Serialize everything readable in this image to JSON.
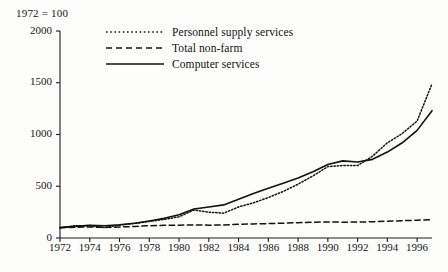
{
  "index_note": "1972 = 100",
  "legend": {
    "position": "top-center",
    "items": [
      {
        "label": "Personnel supply services",
        "style": "dotted",
        "icon": "dotted-line-icon"
      },
      {
        "label": "Total non-farm",
        "style": "dashed",
        "icon": "dashed-line-icon"
      },
      {
        "label": "Computer services",
        "style": "solid",
        "icon": "solid-line-icon"
      }
    ]
  },
  "chart_data": {
    "type": "line",
    "title": "",
    "subtitle": "",
    "xlabel": "",
    "ylabel": "1972 = 100",
    "xlim": [
      1972,
      1997
    ],
    "ylim": [
      0,
      2000
    ],
    "grid": false,
    "yticks": [
      0,
      500,
      1000,
      1500,
      2000
    ],
    "ytick_labels": [
      "0",
      "500",
      "1000",
      "1500",
      "2000"
    ],
    "xticks": [
      1972,
      1974,
      1976,
      1978,
      1980,
      1982,
      1984,
      1986,
      1988,
      1990,
      1992,
      1994,
      1996
    ],
    "xtick_labels": [
      "1972",
      "1974",
      "1976",
      "1978",
      "1980",
      "1982",
      "1984",
      "1986",
      "1988",
      "1990",
      "1992",
      "1994",
      "1996"
    ],
    "x": [
      1972,
      1973,
      1974,
      1975,
      1976,
      1977,
      1978,
      1979,
      1980,
      1981,
      1982,
      1983,
      1984,
      1985,
      1986,
      1987,
      1988,
      1989,
      1990,
      1991,
      1992,
      1993,
      1994,
      1995,
      1996,
      1997
    ],
    "series": [
      {
        "name": "Personnel supply services",
        "style": "dotted",
        "values": [
          100,
          118,
          120,
          100,
          125,
          140,
          160,
          180,
          205,
          270,
          250,
          240,
          300,
          340,
          390,
          450,
          520,
          600,
          690,
          700,
          700,
          790,
          920,
          1010,
          1130,
          1490
        ]
      },
      {
        "name": "Total non-farm",
        "style": "dashed",
        "values": [
          100,
          104,
          106,
          103,
          106,
          112,
          118,
          123,
          124,
          126,
          124,
          126,
          132,
          136,
          139,
          143,
          148,
          152,
          155,
          153,
          154,
          157,
          162,
          167,
          172,
          178
        ]
      },
      {
        "name": "Computer services",
        "style": "solid",
        "values": [
          100,
          112,
          122,
          118,
          128,
          142,
          165,
          190,
          225,
          280,
          300,
          320,
          375,
          430,
          480,
          530,
          580,
          640,
          710,
          745,
          735,
          760,
          830,
          920,
          1040,
          1230
        ]
      }
    ]
  },
  "axis_geometry": {
    "plot_left_px": 60,
    "plot_right_px": 432,
    "plot_top_px": 31,
    "plot_bottom_px": 238
  },
  "colors": {
    "axis": "#1a1a1a",
    "line": "#111111",
    "background": "#fdfdfc",
    "text": "#141414"
  }
}
